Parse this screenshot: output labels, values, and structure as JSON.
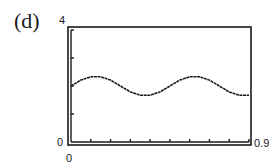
{
  "panel_label": "(d)",
  "chart_data": {
    "type": "line",
    "title": "",
    "panel": "(d)",
    "xlabel": "",
    "ylabel": "",
    "xlim": [
      0,
      0.9
    ],
    "ylim": [
      0,
      4
    ],
    "x_tick_labels": [
      "0",
      "0.9"
    ],
    "y_tick_labels": [
      "0",
      "4"
    ],
    "x_ticks": [
      0.1,
      0.2,
      0.3,
      0.4,
      0.5,
      0.6,
      0.7,
      0.8,
      0.9
    ],
    "y_ticks": [
      1,
      2,
      3,
      4
    ],
    "grid": false,
    "legend": null,
    "series": [
      {
        "name": "y",
        "x": [
          0.0,
          0.05,
          0.1,
          0.15,
          0.2,
          0.25,
          0.3,
          0.35,
          0.4,
          0.45,
          0.5,
          0.55,
          0.6,
          0.65,
          0.7,
          0.75,
          0.8,
          0.85,
          0.9
        ],
        "values": [
          2.0,
          2.21,
          2.33,
          2.33,
          2.21,
          2.0,
          1.79,
          1.67,
          1.67,
          1.79,
          2.0,
          2.21,
          2.33,
          2.33,
          2.21,
          2.0,
          1.79,
          1.67,
          1.67
        ]
      }
    ]
  },
  "labels": {
    "y_max": "4",
    "y_min": "0",
    "x_min": "0",
    "x_max": "0.9"
  },
  "colors": {
    "line": "#1a1a1a",
    "frame": "#1a1a1a",
    "background": "#ffffff"
  }
}
